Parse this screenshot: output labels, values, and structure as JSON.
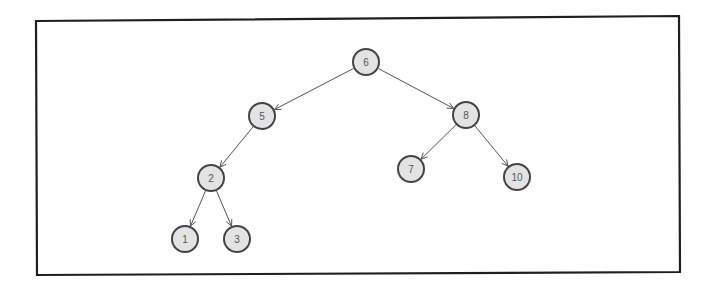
{
  "diagram": {
    "type": "binary-search-tree",
    "frame": {
      "points": [
        [
          36,
          21
        ],
        [
          679,
          16
        ],
        [
          680,
          272
        ],
        [
          37,
          275
        ]
      ],
      "stroke": "#1f1f1f"
    },
    "node_style": {
      "fill": "#e3e3e3",
      "stroke": "#444444",
      "text_color": "#555555",
      "radius": 13
    },
    "nodes": [
      {
        "id": "n6",
        "label": "6",
        "x": 366,
        "y": 62
      },
      {
        "id": "n5",
        "label": "5",
        "x": 262,
        "y": 116
      },
      {
        "id": "n8",
        "label": "8",
        "x": 466,
        "y": 115
      },
      {
        "id": "n2",
        "label": "2",
        "x": 211,
        "y": 178
      },
      {
        "id": "n7",
        "label": "7",
        "x": 411,
        "y": 169
      },
      {
        "id": "n10",
        "label": "10",
        "x": 517,
        "y": 177
      },
      {
        "id": "n1",
        "label": "1",
        "x": 185,
        "y": 239
      },
      {
        "id": "n3",
        "label": "3",
        "x": 237,
        "y": 239
      }
    ],
    "edges": [
      {
        "from": "n6",
        "to": "n5"
      },
      {
        "from": "n6",
        "to": "n8"
      },
      {
        "from": "n5",
        "to": "n2"
      },
      {
        "from": "n8",
        "to": "n7"
      },
      {
        "from": "n8",
        "to": "n10"
      },
      {
        "from": "n2",
        "to": "n1"
      },
      {
        "from": "n2",
        "to": "n3"
      }
    ]
  }
}
